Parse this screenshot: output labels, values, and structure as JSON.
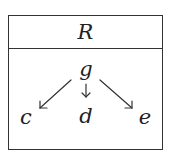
{
  "diagram": {
    "title": "R",
    "nodes": [
      {
        "id": "g",
        "label": "g",
        "x": 86,
        "y": 68
      },
      {
        "id": "c",
        "label": "c",
        "x": 25,
        "y": 116
      },
      {
        "id": "d",
        "label": "d",
        "x": 86,
        "y": 116
      },
      {
        "id": "e",
        "label": "e",
        "x": 145,
        "y": 116
      }
    ],
    "edges": [
      {
        "from": "g",
        "to": "c"
      },
      {
        "from": "g",
        "to": "d"
      },
      {
        "from": "g",
        "to": "e"
      }
    ],
    "colors": {
      "stroke": "#333333",
      "text": "#222222"
    }
  }
}
